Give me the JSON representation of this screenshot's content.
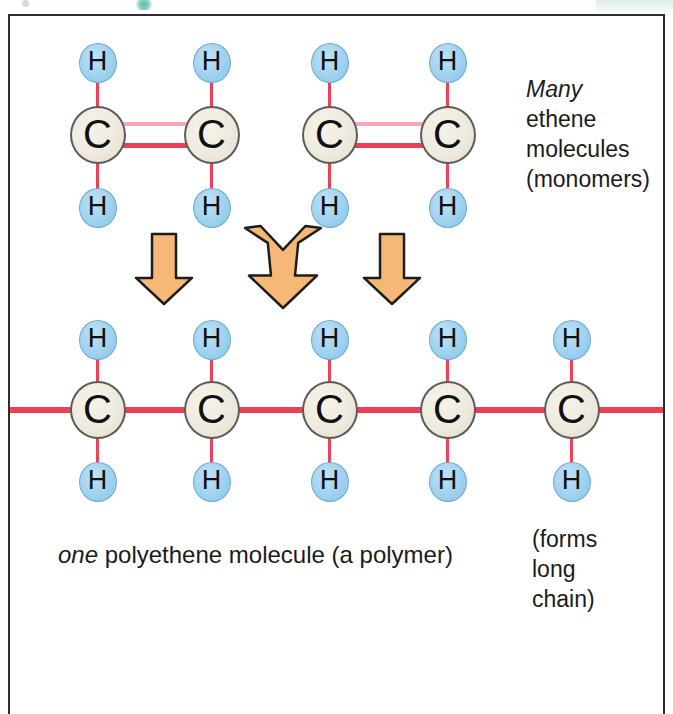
{
  "figure": {
    "frame_color": "#2b2f30",
    "background": "#ffffff"
  },
  "colors": {
    "carbon_fill": "#efeade",
    "carbon_border": "#5c5c58",
    "hydrogen_fill": "#9ed2ef",
    "hydrogen_border": "#6fa9cd",
    "bond_red": "#ee4055",
    "bond_pink": "#f7a8b6",
    "arrow_fill": "#f5b877",
    "arrow_border": "#1d1d1d"
  },
  "atoms": {
    "carbon_label": "C",
    "hydrogen_label": "H"
  },
  "monomer_row": {
    "molecules": [
      {
        "name": "ethene-molecule-1",
        "carbons": [
          {
            "x": 98,
            "y": 135,
            "label": "C"
          },
          {
            "x": 212,
            "y": 135,
            "label": "C"
          }
        ],
        "hydrogens": [
          {
            "x": 98,
            "y": 63,
            "label": "H"
          },
          {
            "x": 212,
            "y": 63,
            "label": "H"
          },
          {
            "x": 98,
            "y": 208,
            "label": "H"
          },
          {
            "x": 212,
            "y": 208,
            "label": "H"
          }
        ],
        "bond_type": "double"
      },
      {
        "name": "ethene-molecule-2",
        "carbons": [
          {
            "x": 330,
            "y": 135,
            "label": "C"
          },
          {
            "x": 448,
            "y": 135,
            "label": "C"
          }
        ],
        "hydrogens": [
          {
            "x": 330,
            "y": 63,
            "label": "H"
          },
          {
            "x": 448,
            "y": 63,
            "label": "H"
          },
          {
            "x": 330,
            "y": 208,
            "label": "H"
          },
          {
            "x": 448,
            "y": 208,
            "label": "H"
          }
        ],
        "bond_type": "double"
      }
    ]
  },
  "arrows": [
    {
      "name": "reaction-arrow-left",
      "type": "down",
      "x": 134,
      "y": 232,
      "width": 60,
      "height": 74
    },
    {
      "name": "reaction-arrow-middle",
      "type": "merge",
      "x": 243,
      "y": 224,
      "width": 80,
      "height": 86
    },
    {
      "name": "reaction-arrow-right",
      "type": "down",
      "x": 362,
      "y": 232,
      "width": 60,
      "height": 74
    }
  ],
  "polymer_row": {
    "name": "polyethene-chain",
    "chain_line": {
      "x_start": 10,
      "x_end": 663,
      "y": 410
    },
    "carbons": [
      {
        "x": 98,
        "y": 410,
        "label": "C"
      },
      {
        "x": 212,
        "y": 410,
        "label": "C"
      },
      {
        "x": 330,
        "y": 410,
        "label": "C"
      },
      {
        "x": 448,
        "y": 410,
        "label": "C"
      },
      {
        "x": 572,
        "y": 410,
        "label": "C"
      }
    ],
    "hydrogens_top": [
      {
        "x": 98,
        "y": 340,
        "label": "H"
      },
      {
        "x": 212,
        "y": 340,
        "label": "H"
      },
      {
        "x": 330,
        "y": 340,
        "label": "H"
      },
      {
        "x": 448,
        "y": 340,
        "label": "H"
      },
      {
        "x": 572,
        "y": 340,
        "label": "H"
      }
    ],
    "hydrogens_bottom": [
      {
        "x": 98,
        "y": 482,
        "label": "H"
      },
      {
        "x": 212,
        "y": 482,
        "label": "H"
      },
      {
        "x": 330,
        "y": 482,
        "label": "H"
      },
      {
        "x": 448,
        "y": 482,
        "label": "H"
      },
      {
        "x": 572,
        "y": 482,
        "label": "H"
      }
    ]
  },
  "captions": {
    "monomers": {
      "line1_emphasis": "Many",
      "line2": "ethene",
      "line3": "molecules",
      "line4": "(monomers)"
    },
    "polymer": {
      "emphasis": "one",
      "rest": " polyethene molecule (a polymer)"
    },
    "chain": {
      "line1": "(forms",
      "line2": "long",
      "line3": "chain)"
    }
  }
}
